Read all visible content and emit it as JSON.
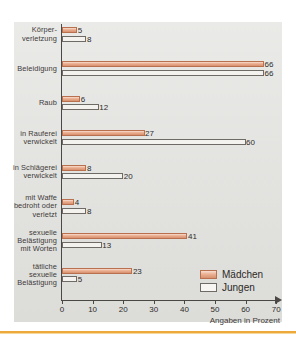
{
  "chart_data": {
    "type": "bar",
    "orientation": "horizontal",
    "title": "",
    "xlabel": "Angaben in Prozent",
    "ylabel": "",
    "xlim": [
      0,
      70
    ],
    "xticks": [
      0,
      10,
      20,
      30,
      40,
      50,
      60,
      70
    ],
    "grid": false,
    "legend_position": "bottom-right",
    "categories": [
      "Körper-\nverletzung",
      "Beleidigung",
      "Raub",
      "in Rauferei\nverwickelt",
      "in Schlägerei\nverwickelt",
      "mit Waffe\nbedroht oder\nverletzt",
      "sexuelle\nBelästigung\nmit Worten",
      "tätliche\nsexuelle\nBelästigung"
    ],
    "series": [
      {
        "name": "Mädchen",
        "color": "#e09f7f",
        "values": [
          5,
          66,
          6,
          27,
          8,
          4,
          41,
          23
        ]
      },
      {
        "name": "Jungen",
        "color": "#f3f2ef",
        "values": [
          8,
          66,
          12,
          60,
          20,
          8,
          13,
          5
        ]
      }
    ]
  },
  "chart": {
    "rows": [
      {
        "label_lines": [
          "Körper-",
          "verletzung"
        ],
        "girls": 5,
        "boys": 8,
        "girls_text": "5",
        "boys_text": "8"
      },
      {
        "label_lines": [
          "Beleidigung"
        ],
        "girls": 66,
        "boys": 66,
        "girls_text": "66",
        "boys_text": "66"
      },
      {
        "label_lines": [
          "Raub"
        ],
        "girls": 6,
        "boys": 12,
        "girls_text": "6",
        "boys_text": "12"
      },
      {
        "label_lines": [
          "in Rauferei",
          "verwickelt"
        ],
        "girls": 27,
        "boys": 60,
        "girls_text": "27",
        "boys_text": "60"
      },
      {
        "label_lines": [
          "in Schlägerei",
          "verwickelt"
        ],
        "girls": 8,
        "boys": 20,
        "girls_text": "8",
        "boys_text": "20"
      },
      {
        "label_lines": [
          "mit Waffe",
          "bedroht oder",
          "verletzt"
        ],
        "girls": 4,
        "boys": 8,
        "girls_text": "4",
        "boys_text": "8"
      },
      {
        "label_lines": [
          "sexuelle",
          "Belästigung",
          "mit Worten"
        ],
        "girls": 41,
        "boys": 13,
        "girls_text": "41",
        "boys_text": "13"
      },
      {
        "label_lines": [
          "tätliche",
          "sexuelle",
          "Belästigung"
        ],
        "girls": 23,
        "boys": 5,
        "girls_text": "23",
        "boys_text": "5"
      }
    ],
    "axis": {
      "ticks": [
        "0",
        "10",
        "20",
        "30",
        "40",
        "50",
        "60",
        "70"
      ],
      "caption": "Angaben in Prozent"
    },
    "legend": [
      {
        "key": "girls",
        "label": "Mädchen"
      },
      {
        "key": "boys",
        "label": "Jungen"
      }
    ]
  },
  "colors": {
    "girls_fill": "#e09f7f",
    "girls_border": "#b8704f",
    "boys_fill": "#f3f2ef",
    "boys_border": "#6e6a66",
    "canvas": "#e4e4e1",
    "rule": "#eda93a"
  }
}
